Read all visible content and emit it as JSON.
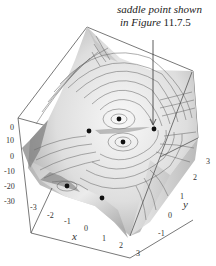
{
  "annotation": {
    "line1": "saddle point shown",
    "line2_prefix": "in Figure",
    "line2_number": "11.7.5"
  },
  "axes": {
    "x": {
      "label": "x",
      "ticks": [
        "-3",
        "-2",
        "-1",
        "0",
        "1",
        "2",
        "3"
      ]
    },
    "y": {
      "label": "y",
      "ticks": [
        "-1",
        "0",
        "1",
        "2",
        "3"
      ]
    },
    "z": {
      "ticks": [
        "0",
        "10",
        "0",
        "-10",
        "-20",
        "-30"
      ]
    }
  },
  "critical_points": [
    {
      "name": "top-maximum",
      "x": 119,
      "y": 119
    },
    {
      "name": "saddle-left",
      "x": 89,
      "y": 131
    },
    {
      "name": "bottom-maximum",
      "x": 123,
      "y": 142
    },
    {
      "name": "saddle-right",
      "x": 154,
      "y": 129
    },
    {
      "name": "lower-left-point",
      "x": 67,
      "y": 186
    },
    {
      "name": "lower-right-point",
      "x": 102,
      "y": 198
    }
  ],
  "colors": {
    "frame": "#555555",
    "contour": "#6a6a6a",
    "point": "#111111",
    "surface_light": "#f4f4f4",
    "surface_dark": "#8a8a8a"
  }
}
